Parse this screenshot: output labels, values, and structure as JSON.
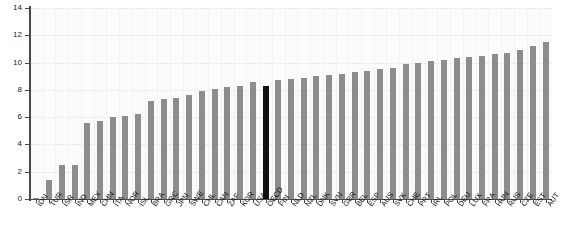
{
  "chart_data": {
    "type": "bar",
    "title": "",
    "subtitle": "",
    "xlabel": "",
    "ylabel": "",
    "ylim": [
      0,
      14
    ],
    "yticks": [
      0,
      2,
      4,
      6,
      8,
      10,
      12,
      14
    ],
    "grid": true,
    "legend": "none",
    "highlight_category": "OECD",
    "highlight_color": "#111111",
    "bar_color": "#8d8d8d",
    "categories": [
      "IDN",
      "TUR",
      "ISR",
      "IND",
      "MEX",
      "CHN",
      "ITA",
      "NOR",
      "ISL",
      "BRA",
      "GRC",
      "JPN",
      "SWE",
      "CHL",
      "CAN",
      "ZAF",
      "KOR",
      "USA",
      "OECD",
      "FIN",
      "NLD",
      "NZL",
      "DNK",
      "SVN",
      "GBR",
      "BEL",
      "ESP",
      "AUS",
      "SVK",
      "CHE",
      "PRT",
      "IRL",
      "POL",
      "DEU",
      "LUX",
      "FRA",
      "HUN",
      "RUS",
      "CZE",
      "EST",
      "AUT"
    ],
    "values": [
      0.1,
      1.4,
      2.5,
      2.5,
      5.6,
      5.7,
      6.0,
      6.1,
      6.2,
      7.2,
      7.3,
      7.4,
      7.6,
      7.9,
      8.1,
      8.2,
      8.3,
      8.6,
      8.3,
      8.7,
      8.8,
      8.9,
      9.0,
      9.1,
      9.2,
      9.3,
      9.4,
      9.5,
      9.6,
      9.9,
      10.0,
      10.1,
      10.2,
      10.3,
      10.4,
      10.5,
      10.6,
      10.7,
      10.9,
      11.2,
      11.5
    ]
  }
}
